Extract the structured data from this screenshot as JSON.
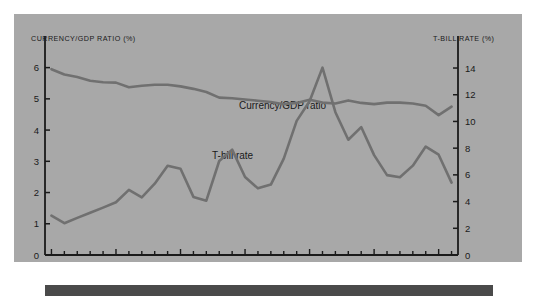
{
  "figure": {
    "background_color": "#a8a8a8",
    "page_color": "#ffffff",
    "line_color": "#707070",
    "axis_color": "#1a1a1a",
    "left_axis_title": "CURRENCY/GDP RATIO (%)",
    "right_axis_title": "T-BILL RATE (%)",
    "series_label_currency": "Currency/GDP ratio",
    "series_label_tbill": "T-bill rate"
  },
  "chart_data": {
    "type": "line",
    "title": "",
    "xlabel": "",
    "ylabel": "CURRENCY/GDP RATIO (%)",
    "y2label": "T-BILL RATE (%)",
    "grid": false,
    "legend": "inline-annotations",
    "xlim": [
      1959.5,
      1991.5
    ],
    "ylim": [
      0,
      6.5
    ],
    "y2lim": [
      0,
      15.2
    ],
    "x_major_ticks": [
      1960,
      1965,
      1970,
      1975,
      1980,
      1985,
      1990
    ],
    "x_major_tick_labels": [
      "1960",
      "1965",
      "1970",
      "1975",
      "1980",
      "1985",
      "1990"
    ],
    "x_minor_tick_step": 1,
    "y_ticks": [
      0,
      1,
      2,
      3,
      4,
      5,
      6
    ],
    "y_tick_labels": [
      "0",
      "1",
      "2",
      "3",
      "4",
      "5",
      "6"
    ],
    "y2_ticks": [
      0,
      2,
      4,
      6,
      8,
      10,
      12,
      14
    ],
    "y2_tick_labels": [
      "0",
      "2",
      "4",
      "6",
      "8",
      "10",
      "12",
      "14"
    ],
    "x": [
      1960,
      1961,
      1962,
      1963,
      1964,
      1965,
      1966,
      1967,
      1968,
      1969,
      1970,
      1971,
      1972,
      1973,
      1974,
      1975,
      1976,
      1977,
      1978,
      1979,
      1980,
      1981,
      1982,
      1983,
      1984,
      1985,
      1986,
      1987,
      1988,
      1989,
      1990,
      1991
    ],
    "series": [
      {
        "name": "Currency/GDP ratio",
        "axis": "left",
        "color": "#707070",
        "values": [
          5.95,
          5.78,
          5.7,
          5.58,
          5.53,
          5.52,
          5.37,
          5.42,
          5.45,
          5.45,
          5.4,
          5.32,
          5.22,
          5.04,
          5.02,
          4.98,
          4.94,
          4.9,
          4.83,
          4.87,
          4.97,
          4.88,
          4.85,
          4.95,
          4.87,
          4.83,
          4.88,
          4.88,
          4.85,
          4.78,
          4.48,
          4.75
        ]
      },
      {
        "name": "T-bill rate",
        "axis": "right",
        "color": "#707070",
        "values": [
          2.95,
          2.38,
          2.78,
          3.16,
          3.55,
          3.95,
          4.88,
          4.32,
          5.34,
          6.68,
          6.46,
          4.35,
          4.07,
          7.04,
          7.89,
          5.84,
          4.99,
          5.27,
          7.22,
          10.04,
          11.51,
          14.03,
          10.69,
          8.63,
          9.58,
          7.48,
          5.98,
          5.82,
          6.69,
          8.12,
          7.51,
          5.42
        ]
      }
    ]
  }
}
